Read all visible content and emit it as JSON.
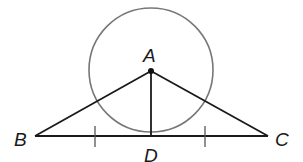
{
  "diagram": {
    "type": "geometry",
    "points": {
      "A": {
        "label": "A",
        "x": 151,
        "y": 70
      },
      "B": {
        "label": "B",
        "x": 35,
        "y": 136
      },
      "C": {
        "label": "C",
        "x": 268,
        "y": 136
      },
      "D": {
        "label": "D",
        "x": 151,
        "y": 136
      }
    },
    "circle": {
      "center": "A",
      "radius": 62,
      "stroke": "#777777"
    },
    "segments": [
      "AB",
      "AC",
      "AD",
      "BC"
    ],
    "tick_marks": [
      "BD",
      "DC"
    ],
    "colors": {
      "line": "#1a1a1a",
      "circle": "#777777",
      "background": "#ffffff"
    }
  }
}
